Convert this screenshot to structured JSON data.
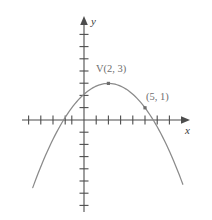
{
  "figure": {
    "kind": "coordinate-plane-parabola",
    "background_color": "#ffffff",
    "axis_color": "#4d4d4d",
    "curve_color": "#8a8a8a",
    "label_color": "#6e6e6e",
    "axis_label_color": "#3a3a3a"
  },
  "axes": {
    "x_label": "x",
    "y_label": "y",
    "x_arrow": "arrow-right",
    "y_arrow": "arrow-up",
    "origin_px": {
      "x": 84,
      "y": 120
    },
    "unit_px": {
      "x": 12.2,
      "y": 12.2
    },
    "x_ticks": [
      -7,
      -6,
      -5,
      -4,
      -3,
      -2,
      -1,
      1,
      2,
      3,
      4,
      5,
      6,
      7,
      8
    ],
    "y_ticks": [
      -7,
      -6,
      -5,
      -4,
      -3,
      -2,
      -1,
      1,
      2,
      3,
      4,
      5,
      6,
      7
    ],
    "x_range": [
      -7.5,
      9.0
    ],
    "y_range": [
      -8.0,
      7.8
    ],
    "tick_length_px": 5,
    "grid": false
  },
  "labels": {
    "vertex": {
      "prefix": "V",
      "coords": "(2, 3)",
      "full": "V(2, 3)"
    },
    "point": {
      "full": "(5, 1)"
    }
  },
  "chart_data": {
    "type": "line",
    "title": "",
    "subtitle": "",
    "xlabel": "x",
    "ylabel": "y",
    "xlim": [
      -7.5,
      9.0
    ],
    "ylim": [
      -8.0,
      7.8
    ],
    "grid": false,
    "legend": "none",
    "equation": "y = -(2/9)(x - 2)^2 + 3",
    "orientation": "opens-downward",
    "vertex": {
      "x": 2,
      "y": 3,
      "label": "V(2, 3)"
    },
    "roots": [
      -1.674,
      5.674
    ],
    "y_intercept": 2.111,
    "series": [
      {
        "name": "parabola",
        "type": "line",
        "color": "#8a8a8a",
        "x": [
          -4.2,
          -3.8,
          -3.4,
          -3.0,
          -2.6,
          -2.2,
          -1.8,
          -1.4,
          -1.0,
          -0.6,
          -0.2,
          0.2,
          0.6,
          1.0,
          1.4,
          1.8,
          2.0,
          2.2,
          2.6,
          3.0,
          3.4,
          3.8,
          4.2,
          4.6,
          5.0,
          5.4,
          5.8,
          6.2,
          6.6,
          7.0,
          7.4,
          7.8,
          8.2
        ],
        "y": [
          -5.0,
          -3.72,
          -2.52,
          -2.56,
          -1.45,
          -0.42,
          -0.52,
          0.48,
          1.0,
          1.55,
          1.92,
          2.2,
          2.56,
          2.78,
          2.92,
          2.99,
          3.0,
          2.99,
          2.92,
          2.78,
          2.56,
          2.28,
          1.92,
          1.49,
          1.0,
          0.44,
          -0.18,
          -0.87,
          -1.63,
          -2.44,
          -3.32,
          -4.26,
          -5.27
        ],
        "markers": [
          {
            "x": 2,
            "y": 3,
            "label": "V(2, 3)"
          },
          {
            "x": 5,
            "y": 1,
            "label": "(5, 1)"
          }
        ]
      }
    ]
  }
}
